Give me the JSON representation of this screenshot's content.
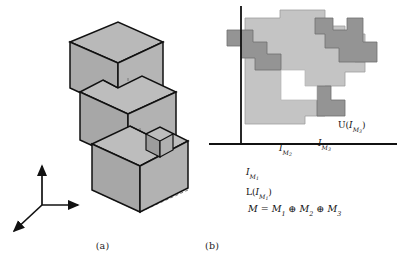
{
  "figure": {
    "background_color": "#ffffff",
    "width": 402,
    "height": 270,
    "subcaptions": {
      "a": "(a)",
      "b": "(b)"
    }
  },
  "colors": {
    "cube_face_light": "#b8b8b8",
    "cube_face_mid": "#a9a9a9",
    "cube_face_dark": "#9a9a9a",
    "outline": "#111111",
    "hidden_edge": "#6b6b6b",
    "staircase_light": "#c2c2c2",
    "staircase_dark": "#949494",
    "axis": "#111111",
    "text": "#111111"
  },
  "panel_a": {
    "name": "three-stacked-notched-cubes",
    "description": "Isometric view of three stacked cubic blocks with step notches and dashed hidden edges",
    "cube_count": 3,
    "axes": {
      "name": "coordinate-axis-triad",
      "arrows": [
        "up",
        "right",
        "down-left"
      ]
    }
  },
  "panel_b": {
    "name": "staircase-interval-diagram",
    "axis": {
      "vertical": true,
      "horizontal": true
    },
    "labels": {
      "upper_bound": {
        "fn": "U",
        "arg_base": "I",
        "arg_sub": "M",
        "arg_sub2": "3"
      },
      "lower_bound": {
        "fn": "L",
        "arg_base": "I",
        "arg_sub": "M",
        "arg_sub2": "1"
      },
      "region_1": {
        "base": "I",
        "sub": "M",
        "sub2": "1"
      },
      "region_2": {
        "base": "I",
        "sub": "M",
        "sub2": "2"
      },
      "region_3": {
        "base": "I",
        "sub": "M",
        "sub2": "3"
      }
    },
    "equation": {
      "lhs": "M",
      "eq": "=",
      "term1": {
        "base": "M",
        "sub": "1"
      },
      "op1": "⊕",
      "term2": {
        "base": "M",
        "sub": "2"
      },
      "op2": "⊕",
      "term3": {
        "base": "M",
        "sub": "3"
      }
    }
  }
}
